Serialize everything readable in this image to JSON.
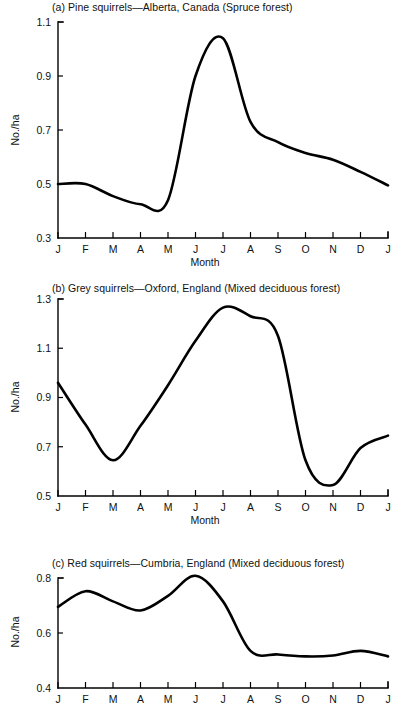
{
  "figure": {
    "axis_label_y": "No./ha",
    "axis_label_x": "Month",
    "month_ticks": [
      "J",
      "F",
      "M",
      "A",
      "M",
      "J",
      "J",
      "A",
      "S",
      "O",
      "N",
      "D",
      "J"
    ],
    "line_color": "#000000",
    "axis_color": "#000000",
    "background_color": "#ffffff"
  },
  "panels": [
    {
      "key": "a",
      "title": "(a)  Pine squirrels—Alberta, Canada (Spruce forest)",
      "y_ticks": [
        "1.1",
        "0.9",
        "0.7",
        "0.5",
        "0.3"
      ]
    },
    {
      "key": "b",
      "title": "(b)  Grey squirrels—Oxford, England (Mixed deciduous forest)",
      "y_ticks": [
        "1.3",
        "1.1",
        "0.9",
        "0.7",
        "0.5"
      ]
    },
    {
      "key": "c",
      "title": "(c)  Red squirrels—Cumbria, England (Mixed deciduous forest)",
      "y_ticks": [
        "0.8",
        "0.6",
        "0.4"
      ]
    }
  ],
  "chart_data": [
    {
      "type": "line",
      "title": "(a)  Pine squirrels—Alberta, Canada (Spruce forest)",
      "xlabel": "Month",
      "ylabel": "No./ha",
      "categories": [
        "J",
        "F",
        "M",
        "A",
        "M",
        "J",
        "J",
        "A",
        "S",
        "O",
        "N",
        "D",
        "J"
      ],
      "values": [
        0.5,
        0.5,
        0.455,
        0.425,
        0.44,
        0.9,
        1.04,
        0.73,
        0.655,
        0.615,
        0.59,
        0.545,
        0.495
      ],
      "ylim": [
        0.3,
        1.1
      ],
      "yticks": [
        0.3,
        0.5,
        0.7,
        0.9,
        1.1
      ],
      "grid": false,
      "legend": "none",
      "notes": "Sharp rise between May and June, peak ~1.04 in July, gradual decline through winter"
    },
    {
      "type": "line",
      "title": "(b)  Grey squirrels—Oxford, England (Mixed deciduous forest)",
      "xlabel": "Month",
      "ylabel": "No./ha",
      "categories": [
        "J",
        "F",
        "M",
        "A",
        "M",
        "J",
        "J",
        "A",
        "S",
        "O",
        "N",
        "D",
        "J"
      ],
      "values": [
        0.96,
        0.79,
        0.645,
        0.785,
        0.95,
        1.13,
        1.265,
        1.23,
        1.15,
        0.645,
        0.545,
        0.695,
        0.745
      ],
      "ylim": [
        0.5,
        1.3
      ],
      "yticks": [
        0.5,
        0.7,
        0.9,
        1.1,
        1.3
      ],
      "grid": false,
      "legend": "none",
      "notes": "Minimum ~0.645 in March, peak ~1.265 in July, steep drop Sept-Nov to ~0.545"
    },
    {
      "type": "line",
      "title": "(c)  Red squirrels—Cumbria, England (Mixed deciduous forest)",
      "xlabel": "Month",
      "ylabel": "No./ha",
      "categories": [
        "J",
        "F",
        "M",
        "A",
        "M",
        "J",
        "J",
        "A",
        "S",
        "O",
        "N",
        "D",
        "J"
      ],
      "values": [
        0.695,
        0.752,
        0.715,
        0.682,
        0.735,
        0.808,
        0.715,
        0.535,
        0.522,
        0.515,
        0.518,
        0.535,
        0.515
      ],
      "ylim": [
        0.4,
        0.8
      ],
      "yticks": [
        0.4,
        0.6,
        0.8
      ],
      "grid": false,
      "legend": "none",
      "notes": "Double hump Feb and June (peak ~0.808), sharp drop to ~0.52 plateau after July"
    }
  ],
  "layout": {
    "panel_geometry": [
      {
        "top": 14,
        "plot_left": 58,
        "plot_right": 388,
        "plot_top": 22,
        "plot_bottom": 238,
        "title_left": 52,
        "title_top": 2,
        "ylabel_center_y": 130,
        "xlabel_top": 258
      },
      {
        "top": 281,
        "plot_left": 58,
        "plot_right": 388,
        "plot_top": 299,
        "plot_bottom": 496,
        "title_left": 52,
        "title_top": 281,
        "ylabel_center_y": 397,
        "xlabel_top": 516
      },
      {
        "top": 556,
        "plot_left": 58,
        "plot_right": 388,
        "plot_top": 578,
        "plot_bottom": 688,
        "title_left": 52,
        "title_top": 556,
        "ylabel_center_y": 632,
        "xlabel_top": 706
      }
    ]
  }
}
